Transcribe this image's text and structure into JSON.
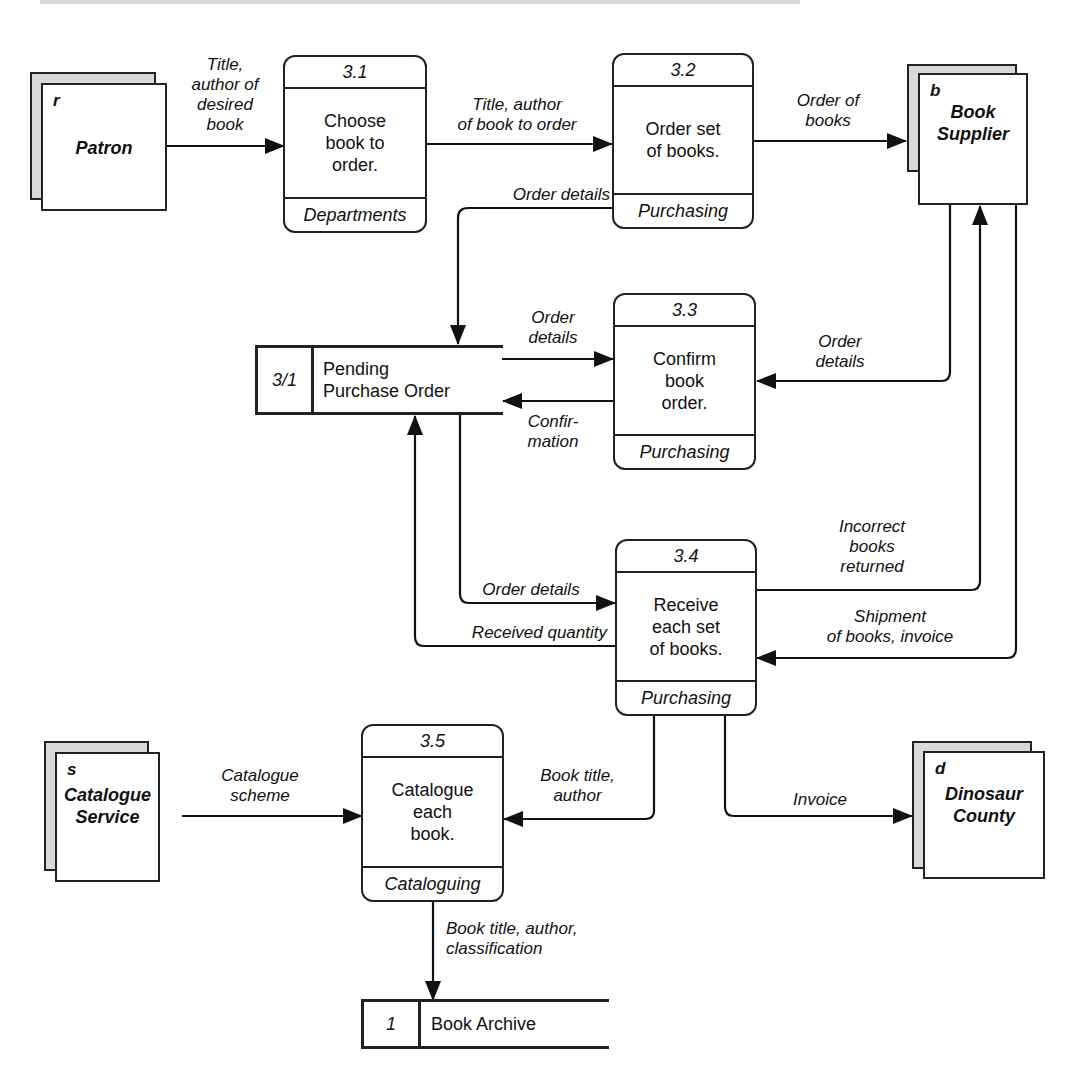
{
  "diagram": {
    "type": "data-flow-diagram",
    "external_entities": [
      {
        "id": "patron",
        "code": "r",
        "name": "Patron"
      },
      {
        "id": "book-supplier",
        "code": "b",
        "name": "Book Supplier"
      },
      {
        "id": "catalogue-service",
        "code": "s",
        "name": "Catalogue Service"
      },
      {
        "id": "dinosaur-county",
        "code": "d",
        "name": "Dinosaur County"
      }
    ],
    "processes": [
      {
        "id": "3.1",
        "label": "Choose book to order.",
        "department": "Departments"
      },
      {
        "id": "3.2",
        "label": "Order set of books.",
        "department": "Purchasing"
      },
      {
        "id": "3.3",
        "label": "Confirm book order.",
        "department": "Purchasing"
      },
      {
        "id": "3.4",
        "label": "Receive each set of books.",
        "department": "Purchasing"
      },
      {
        "id": "3.5",
        "label": "Catalogue each book.",
        "department": "Cataloguing"
      }
    ],
    "data_stores": [
      {
        "id": "3/1",
        "name": "Pending Purchase Order"
      },
      {
        "id": "1",
        "name": "Book Archive"
      }
    ],
    "flows": [
      {
        "from": "Patron",
        "to": "3.1",
        "label": "Title, author of desired book"
      },
      {
        "from": "3.1",
        "to": "3.2",
        "label": "Title, author of book to order"
      },
      {
        "from": "3.2",
        "to": "Book Supplier",
        "label": "Order of books"
      },
      {
        "from": "3.2",
        "to": "3/1",
        "label": "Order details"
      },
      {
        "from": "3/1",
        "to": "3.3",
        "label": "Order details"
      },
      {
        "from": "3.3",
        "to": "3/1",
        "label": "Confir- mation"
      },
      {
        "from": "Book Supplier",
        "to": "3.3",
        "label": "Order details"
      },
      {
        "from": "3/1",
        "to": "3.4",
        "label": "Order details"
      },
      {
        "from": "3.4",
        "to": "3/1",
        "label": "Received quantity"
      },
      {
        "from": "3.4",
        "to": "Book Supplier",
        "label": "Incorrect books returned"
      },
      {
        "from": "Book Supplier",
        "to": "3.4",
        "label": "Shipment of books, invoice"
      },
      {
        "from": "Catalogue Service",
        "to": "3.5",
        "label": "Catalogue scheme"
      },
      {
        "from": "3.4",
        "to": "3.5",
        "label": "Book title, author"
      },
      {
        "from": "3.4",
        "to": "Dinosaur County",
        "label": "Invoice"
      },
      {
        "from": "3.5",
        "to": "1",
        "label": "Book title, author, classification"
      }
    ]
  },
  "entities": {
    "patron": {
      "code": "r",
      "name": "Patron"
    },
    "supplier": {
      "code": "b",
      "name_line1": "Book",
      "name_line2": "Supplier"
    },
    "catalogue": {
      "code": "s",
      "name_line1": "Catalogue",
      "name_line2": "Service"
    },
    "county": {
      "code": "d",
      "name_line1": "Dinosaur",
      "name_line2": "County"
    }
  },
  "procs": {
    "p31": {
      "id": "3.1",
      "l1": "Choose",
      "l2": "book to",
      "l3": "order.",
      "dept": "Departments"
    },
    "p32": {
      "id": "3.2",
      "l1": "Order set",
      "l2": "of books.",
      "dept": "Purchasing"
    },
    "p33": {
      "id": "3.3",
      "l1": "Confirm",
      "l2": "book",
      "l3": "order.",
      "dept": "Purchasing"
    },
    "p34": {
      "id": "3.4",
      "l1": "Receive",
      "l2": "each set",
      "l3": "of books.",
      "dept": "Purchasing"
    },
    "p35": {
      "id": "3.5",
      "l1": "Catalogue",
      "l2": "each",
      "l3": "book.",
      "dept": "Cataloguing"
    }
  },
  "stores": {
    "pending": {
      "id": "3/1",
      "l1": "Pending",
      "l2": "Purchase Order"
    },
    "archive": {
      "id": "1",
      "name": "Book Archive"
    }
  },
  "labels": {
    "f1": [
      "Title,",
      "author of",
      "desired",
      "book"
    ],
    "f2": [
      "Title, author",
      "of book to order"
    ],
    "f3": [
      "Order of",
      "books"
    ],
    "f4": [
      "Order details"
    ],
    "f5": [
      "Order",
      "details"
    ],
    "f6": [
      "Confir-",
      "mation"
    ],
    "f7": [
      "Order",
      "details"
    ],
    "f8": [
      "Order details"
    ],
    "f9": [
      "Received quantity"
    ],
    "f10": [
      "Incorrect",
      "books",
      "returned"
    ],
    "f11": [
      "Shipment",
      "of books, invoice"
    ],
    "f12": [
      "Catalogue",
      "scheme"
    ],
    "f13": [
      "Book title,",
      "author"
    ],
    "f14": [
      "Invoice"
    ],
    "f15": [
      "Book title, author,",
      "classification"
    ]
  }
}
